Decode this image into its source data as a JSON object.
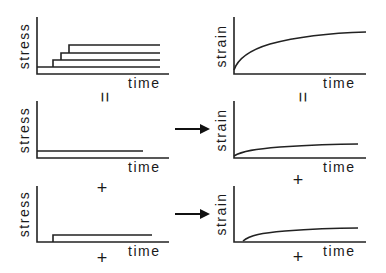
{
  "labels": {
    "stress": "stress",
    "strain": "strain",
    "time": "time"
  },
  "symbols": {
    "equals": "=",
    "plus": "+"
  },
  "panels": [
    {
      "id": "stress-stepped",
      "ylabel": "stress",
      "xlabel": "time",
      "description": "Stepped stress increments (staircase of 4 levels)"
    },
    {
      "id": "strain-total",
      "ylabel": "strain",
      "xlabel": "time",
      "description": "Total creep strain rising and leveling off"
    },
    {
      "id": "stress-step-1",
      "ylabel": "stress",
      "xlabel": "time",
      "description": "Constant stress applied from start"
    },
    {
      "id": "strain-response-1",
      "ylabel": "strain",
      "xlabel": "time",
      "description": "Creep strain response to first stress step"
    },
    {
      "id": "stress-step-2",
      "ylabel": "stress",
      "xlabel": "time",
      "description": "Stress step applied after a delay"
    },
    {
      "id": "strain-response-2",
      "ylabel": "strain",
      "xlabel": "time",
      "description": "Delayed creep strain response to second stress step"
    }
  ],
  "colors": {
    "line": "#222222",
    "background": "#ffffff"
  }
}
